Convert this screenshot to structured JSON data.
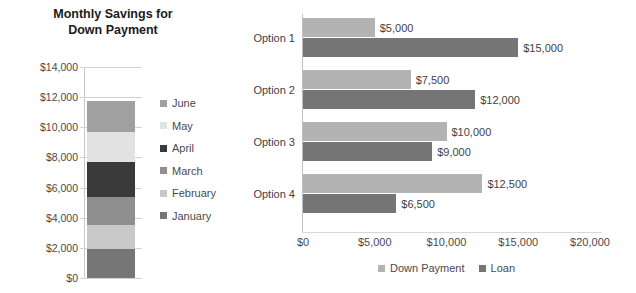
{
  "chart_data": [
    {
      "type": "bar",
      "subtype": "stacked-column",
      "title": "Monthly Savings for Down Payment",
      "title_lines": [
        "Monthly Savings for",
        "Down Payment"
      ],
      "xlabel": "",
      "ylabel": "",
      "ylim": [
        0,
        14000
      ],
      "ytick_labels": [
        "$14,000",
        "$12,000",
        "$10,000",
        "$8,000",
        "$6,000",
        "$4,000",
        "$2,000",
        "$0"
      ],
      "ytick_values": [
        14000,
        12000,
        10000,
        8000,
        6000,
        4000,
        2000,
        0
      ],
      "grid": true,
      "legend_position": "right",
      "categories": [
        "Savings"
      ],
      "total": 11750,
      "series": [
        {
          "name": "June",
          "value": 2050,
          "color": "#a0a0a0"
        },
        {
          "name": "May",
          "value": 2000,
          "color": "#e2e2e2"
        },
        {
          "name": "April",
          "value": 2300,
          "color": "#3a3a3a"
        },
        {
          "name": "March",
          "value": 1850,
          "color": "#8f8f8f"
        },
        {
          "name": "February",
          "value": 1650,
          "color": "#c9c9c9"
        },
        {
          "name": "January",
          "value": 1900,
          "color": "#767676"
        }
      ]
    },
    {
      "type": "bar",
      "subtype": "grouped-horizontal",
      "title": "",
      "xlabel": "",
      "ylabel": "",
      "xlim": [
        0,
        20000
      ],
      "xtick_labels": [
        "$0",
        "$5,000",
        "$10,000",
        "$15,000",
        "$20,000"
      ],
      "xtick_values": [
        0,
        5000,
        10000,
        15000,
        20000
      ],
      "grid": false,
      "legend_position": "bottom",
      "categories": [
        "Option 1",
        "Option 2",
        "Option 3",
        "Option 4"
      ],
      "series": [
        {
          "name": "Down Payment",
          "color": "#b3b3b3",
          "values": [
            5000,
            7500,
            10000,
            12500
          ],
          "labels": [
            "$5,000",
            "$7,500",
            "$10,000",
            "$12,500"
          ]
        },
        {
          "name": "Loan",
          "color": "#757575",
          "values": [
            15000,
            12000,
            9000,
            6500
          ],
          "labels": [
            "$15,000",
            "$12,000",
            "$9,000",
            "$6,500"
          ]
        }
      ]
    }
  ],
  "colors": {
    "text": "#3f3f3f",
    "axis": "#c8c8c8",
    "grid": "#d2d2d2",
    "background": "#ffffff"
  }
}
